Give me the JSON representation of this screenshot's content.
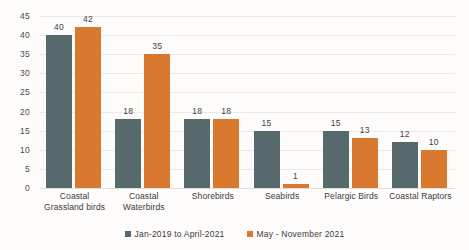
{
  "chart_data": {
    "type": "bar",
    "title": "",
    "subtitle": "",
    "xlabel": "",
    "ylabel": "",
    "ylim": [
      0,
      45
    ],
    "ytick_step": 5,
    "yticks": [
      "45",
      "40",
      "35",
      "30",
      "25",
      "20",
      "15",
      "10",
      "5",
      "0"
    ],
    "grid": true,
    "legend_position": "bottom",
    "categories": [
      "Coastal\nGrassland birds",
      "Coastal\nWaterbirds",
      "Shorebirds",
      "Seabirds",
      "Pelargic Birds",
      "Coastal Raptors"
    ],
    "category_lines": [
      [
        "Coastal",
        "Grassland birds"
      ],
      [
        "Coastal",
        "Waterbirds"
      ],
      [
        "Shorebirds"
      ],
      [
        "Seabirds"
      ],
      [
        "Pelargic Birds"
      ],
      [
        "Coastal Raptors"
      ]
    ],
    "series": [
      {
        "name": "Jan-2019 to April-2021",
        "color": "#566a6e",
        "values": [
          40,
          18,
          18,
          15,
          15,
          12
        ]
      },
      {
        "name": "May - November 2021",
        "color": "#d9782f",
        "values": [
          42,
          35,
          18,
          1,
          13,
          10
        ]
      }
    ]
  },
  "legend": {
    "items": [
      {
        "label": "Jan-2019 to April-2021",
        "color": "#566a6e"
      },
      {
        "label": "May - November 2021",
        "color": "#d9782f"
      }
    ]
  },
  "colors": {
    "series_1": "#566a6e",
    "series_2": "#d9782f",
    "gridline": "#e9e9e9",
    "text": "#3a3a3a",
    "background": "#fdfcfb"
  }
}
